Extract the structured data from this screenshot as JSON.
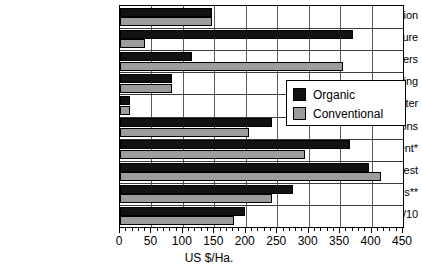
{
  "chart_data": {
    "type": "bar",
    "orientation": "horizontal",
    "title": "",
    "xlabel": "US $/Ha.",
    "ylabel": "",
    "xlim": [
      0,
      450
    ],
    "xticks": [
      0,
      50,
      100,
      150,
      200,
      250,
      300,
      350,
      400,
      450
    ],
    "minor_tick_interval": 10,
    "grid": "vertical-and-horizontal",
    "legend_position": "center-right",
    "categories": [
      "Seed preparation",
      "Manure",
      "Fertilizers",
      "Sowing",
      "Water",
      "Cultural operations",
      "Pest management*",
      "Harvest",
      "Business overheads**",
      "Total/10"
    ],
    "series": [
      {
        "name": "Organic",
        "color": "#121212",
        "values": [
          147,
          370,
          115,
          82,
          16,
          242,
          365,
          396,
          275,
          199
        ]
      },
      {
        "name": "Conventional",
        "color": "#9c9c9c",
        "values": [
          147,
          40,
          355,
          82,
          16,
          205,
          294,
          415,
          242,
          181
        ]
      }
    ]
  },
  "legend": {
    "entries": [
      {
        "label": "Organic",
        "swatch": "black-square-swatch"
      },
      {
        "label": "Conventional",
        "swatch": "gray-square-swatch"
      }
    ]
  }
}
